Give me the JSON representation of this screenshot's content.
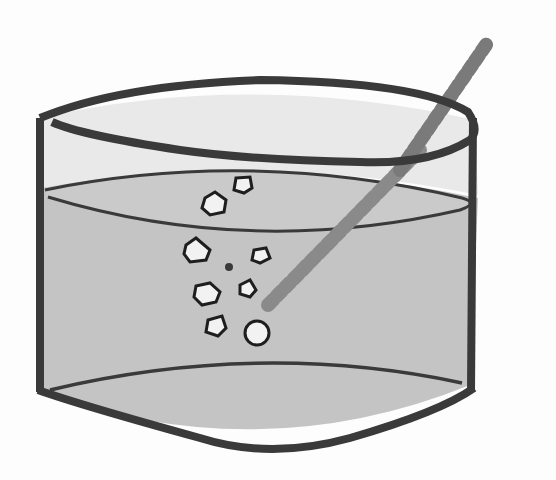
{
  "illustration": {
    "subject": "beaker with liquid, bubbles and stirring rod",
    "colors": {
      "background": "#fdfdfd",
      "outline": "#3a3a3a",
      "liquid": "#c4c4c4",
      "glass_interior": "#e6e6e6",
      "bubble_fill": "#f2f2f2",
      "rod": "#7a7a7a"
    },
    "bubble_count": 9
  }
}
